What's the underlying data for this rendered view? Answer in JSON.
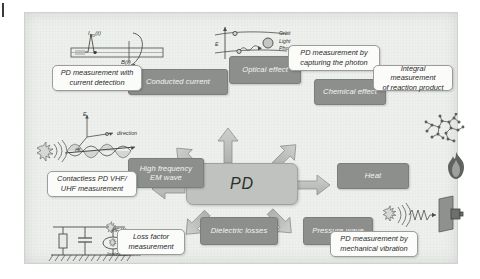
{
  "diagram": {
    "center_node": {
      "label": "PD"
    },
    "colors": {
      "background": "#eef0ee",
      "effect_box": "#8c8f8c",
      "effect_box_text": "#f4f5f4",
      "center_box": "#bfc2bf",
      "callout_box": "#fbfbfa",
      "callout_text": "#2a2c2a",
      "arrow": "#b9bcb9",
      "frame_border": "#cfd2cf"
    },
    "effects": [
      {
        "id": "conducted-current",
        "label": "Conducted current"
      },
      {
        "id": "optical-effect",
        "label": "Optical effect"
      },
      {
        "id": "chemical-effect",
        "label": "Chemical effect"
      },
      {
        "id": "heat",
        "label": "Heat"
      },
      {
        "id": "pressure-wave",
        "label": "Pressure wave"
      },
      {
        "id": "dielectric-losses",
        "label": "Dielectric losses"
      },
      {
        "id": "hf-em-wave",
        "label": "High frequency\nEM wave"
      }
    ],
    "measurements": [
      {
        "id": "current-detection",
        "label": "PD measurement with\ncurrent detection"
      },
      {
        "id": "capturing-photon",
        "label": "PD measurement by\ncapturing the photon"
      },
      {
        "id": "reaction-product",
        "label": "Integral measurement\nof reaction product"
      },
      {
        "id": "mechanical-vibration",
        "label": "PD measurement by\nmechanical vibration"
      },
      {
        "id": "loss-factor",
        "label": "Loss factor\nmeasurement"
      },
      {
        "id": "vhf-uhf",
        "label": "Contactless PD VHF/\nUHF measurement"
      }
    ],
    "illustrations": {
      "current_pulse": {
        "name": "current-pulse-in-cable",
        "labels": [
          "I",
          "PD",
          "(t)",
          "B(t)"
        ]
      },
      "photon_orbit": {
        "name": "electron-orbit-photon",
        "labels": [
          "E",
          "Orbit",
          "Light",
          "Photon"
        ]
      },
      "em_wave": {
        "name": "electromagnetic-wave",
        "labels": [
          "E",
          "H",
          "direction"
        ]
      },
      "circuit": {
        "name": "loss-equivalent-circuit",
        "labels": [
          "HF Waves",
          "Ionization loss"
        ]
      },
      "molecule": {
        "name": "reaction-product-molecule"
      },
      "flame": {
        "name": "flame-heat-icon"
      },
      "acoustic": {
        "name": "acoustic-sensor-setup"
      }
    },
    "arrows": [
      {
        "id": "arrow-up",
        "from": "PD",
        "to": "Optical effect"
      },
      {
        "id": "arrow-up-left",
        "from": "PD",
        "to": "Conducted current"
      },
      {
        "id": "arrow-up-right",
        "from": "PD",
        "to": "Chemical effect"
      },
      {
        "id": "arrow-right",
        "from": "PD",
        "to": "Heat"
      },
      {
        "id": "arrow-left",
        "from": "PD",
        "to": "High frequency EM wave"
      },
      {
        "id": "arrow-down-left",
        "from": "PD",
        "to": "Dielectric losses"
      },
      {
        "id": "arrow-down-right",
        "from": "PD",
        "to": "Pressure wave"
      }
    ]
  }
}
